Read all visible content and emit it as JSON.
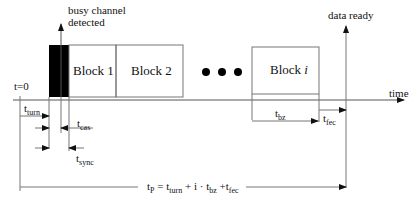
{
  "diagram": {
    "annotations": {
      "busy_channel_line1": "busy channel",
      "busy_channel_line2": "detected",
      "data_ready": "data ready",
      "time_axis": "time",
      "t_zero": "t=0"
    },
    "blocks": [
      {
        "label": "Block 1"
      },
      {
        "label": "Block 2"
      },
      {
        "label_prefix": "Block ",
        "label_italic": "i"
      }
    ],
    "ellipsis": "●●●",
    "timings": {
      "t_turn": {
        "base": "t",
        "sub": "turn"
      },
      "t_cas": {
        "base": "t",
        "sub": "cas"
      },
      "t_sync": {
        "base": "t",
        "sub": "sync"
      },
      "t_bz": {
        "base": "t",
        "sub": "bz"
      },
      "t_fec": {
        "base": "t",
        "sub": "fec"
      }
    },
    "formula": {
      "lhs_base": "t",
      "lhs_sub": "P",
      "eq": " = ",
      "term1_base": "t",
      "term1_sub": "turn",
      "plus1": " + i · ",
      "term2_base": "t",
      "term2_sub": "bz",
      "plus2": " +",
      "term3_base": "t",
      "term3_sub": "fec"
    },
    "colors": {
      "line": "#555555",
      "busy_block": "#000000"
    }
  }
}
